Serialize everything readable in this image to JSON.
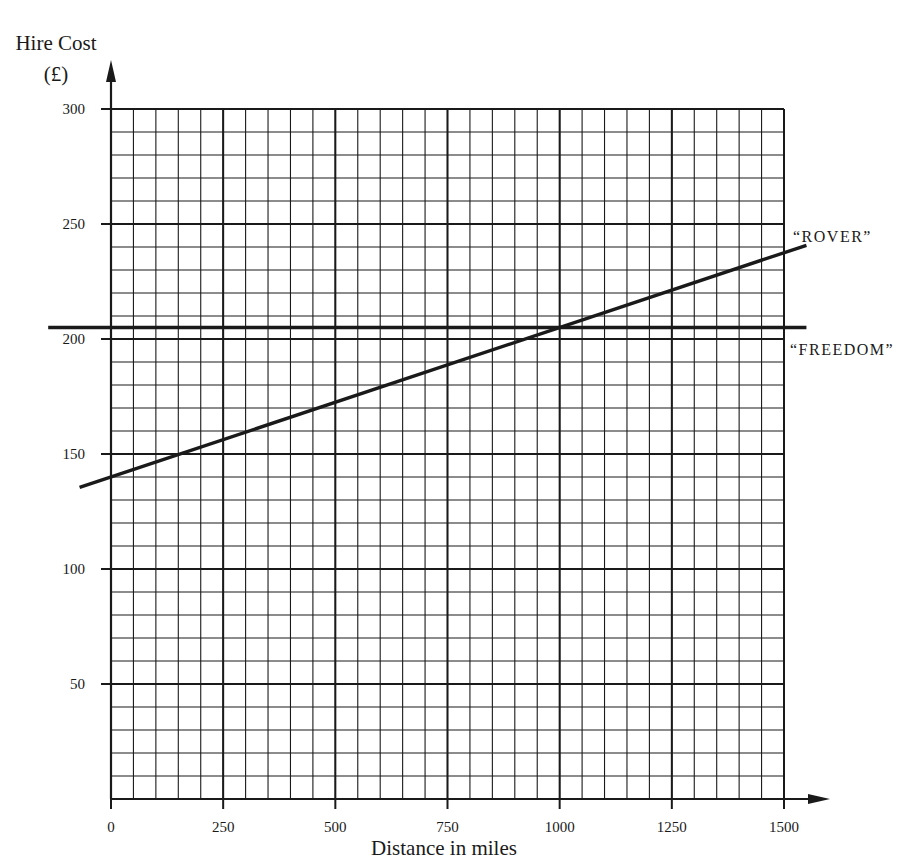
{
  "chart_data": {
    "type": "line",
    "title": "",
    "ylabel": "Hire Cost",
    "ylabel_unit": "(£)",
    "xlabel": "Distance in miles",
    "xlim": [
      0,
      1500
    ],
    "ylim": [
      0,
      300
    ],
    "x_ticks": [
      0,
      250,
      500,
      750,
      1000,
      1250,
      1500
    ],
    "y_ticks": [
      50,
      100,
      150,
      200,
      250,
      300
    ],
    "x_minor_step": 50,
    "y_minor_step": 10,
    "grid": true,
    "legend_position": "inline labels at right end of lines",
    "series": [
      {
        "name": "“ROVER”",
        "x": [
          0,
          250,
          500,
          750,
          1000,
          1250,
          1500
        ],
        "values": [
          140,
          156.25,
          172.5,
          188.75,
          205,
          221.25,
          237.5
        ],
        "line_extent_x": [
          -70,
          1550
        ]
      },
      {
        "name": "“FREEDOM”",
        "x": [
          0,
          250,
          500,
          750,
          1000,
          1250,
          1500
        ],
        "values": [
          205,
          205,
          205,
          205,
          205,
          205,
          205
        ],
        "line_extent_x": [
          -140,
          1550
        ]
      }
    ],
    "annotations": [
      "Lines intersect at (1000, 205)"
    ]
  },
  "labels": {
    "ylabel_line1": "Hire Cost",
    "ylabel_line2": "(£)",
    "xlabel": "Distance in miles",
    "rover": "“ROVER”",
    "freedom": "“FREEDOM”"
  },
  "colors": {
    "ink": "#1a1a1a",
    "background": "#ffffff"
  }
}
